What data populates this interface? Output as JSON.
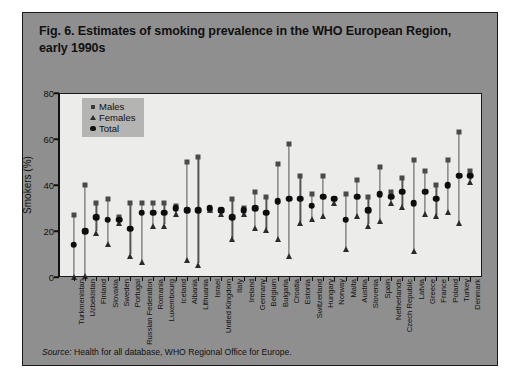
{
  "figure": {
    "title": "Fig. 6. Estimates of smoking prevalence in the WHO European Region, early 1990s",
    "source_label": "Source:",
    "source_text": " Health for all database, WHO Regional Office for Europe."
  },
  "legend": {
    "position": "top-left-inside",
    "items": [
      {
        "label": "Males",
        "marker": "square"
      },
      {
        "label": "Females",
        "marker": "triangle"
      },
      {
        "label": "Total",
        "marker": "circle"
      }
    ]
  },
  "chart_data": {
    "type": "scatter",
    "title": "Fig. 6. Estimates of smoking prevalence in the WHO European Region, early 1990s",
    "xlabel": "",
    "ylabel": "Smokers (%)",
    "ylim": [
      0,
      80
    ],
    "yticks": [
      0,
      20,
      40,
      60,
      80
    ],
    "grid": false,
    "legend": [
      "Males",
      "Females",
      "Total"
    ],
    "categories": [
      "Turkmenistan",
      "Uzbekistan",
      "Finland",
      "Slovakia",
      "Sweden",
      "Portugal",
      "Russian Federation",
      "Romania",
      "Luxembourg",
      "Iceland",
      "Albania",
      "Lithuania",
      "Israel",
      "United Kingdom",
      "Italy",
      "Ireland",
      "Germany",
      "Belgium",
      "Bulgaria",
      "Croatia",
      "Estonia",
      "Switzerland",
      "Hungary",
      "Norway",
      "Malta",
      "Austria",
      "Slovenia",
      "Spain",
      "Netherlands",
      "Czech Republic",
      "Latvia",
      "Greece",
      "France",
      "Poland",
      "Turkey",
      "Denmark"
    ],
    "series": [
      {
        "name": "Males",
        "marker": "square",
        "values": [
          27,
          40,
          32,
          34,
          26,
          32,
          32,
          32,
          32,
          31,
          50,
          52,
          29,
          29,
          34,
          30,
          37,
          35,
          49,
          58,
          44,
          36,
          44,
          34,
          36,
          42,
          35,
          48,
          37,
          43,
          51,
          46,
          40,
          51,
          63,
          46
        ]
      },
      {
        "name": "Females",
        "marker": "triangle",
        "values": [
          0.5,
          1,
          20,
          15,
          24,
          10,
          7,
          23,
          23,
          28,
          8,
          6,
          30,
          28,
          17,
          28,
          22,
          21,
          17,
          10,
          24,
          26,
          27,
          33,
          13,
          27,
          23,
          25,
          33,
          31,
          12,
          28,
          27,
          29,
          24,
          42
        ]
      },
      {
        "name": "Total",
        "marker": "circle",
        "values": [
          14,
          20,
          26,
          25,
          25,
          21,
          28,
          28,
          28,
          30,
          29,
          29,
          30,
          29,
          26,
          29,
          30,
          28,
          33,
          34,
          34,
          31,
          35,
          34,
          25,
          35,
          29,
          36,
          35,
          37,
          32,
          37,
          34,
          40,
          44,
          44
        ]
      }
    ]
  },
  "colors": {
    "panel_background": "#8f8f8f",
    "plot_background": "#ececeb",
    "legend_background": "#b4b4b2",
    "axis": "#111111",
    "males_marker": "#4a4a4a",
    "females_marker": "#2b2b2b",
    "total_marker": "#0d0d0d",
    "stem": "#555555"
  }
}
